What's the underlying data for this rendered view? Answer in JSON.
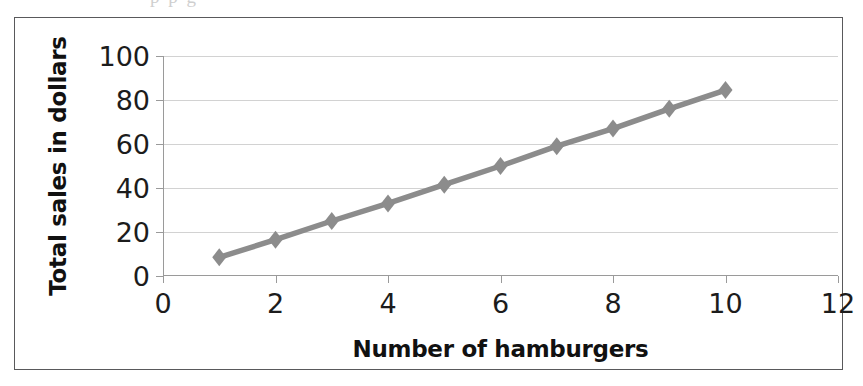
{
  "figure": {
    "scan_artifact_text": "p  p  g"
  },
  "chart_data": {
    "type": "line",
    "title": "",
    "xlabel": "Number of hamburgers",
    "ylabel": "Total sales in dollars",
    "x": [
      1,
      2,
      3,
      4,
      5,
      6,
      7,
      8,
      9,
      10
    ],
    "values": [
      8.5,
      16.5,
      25,
      33,
      41.5,
      50,
      59,
      67,
      76,
      84.5
    ],
    "series": [
      {
        "name": "Total sales",
        "values": [
          8.5,
          16.5,
          25,
          33,
          41.5,
          50,
          59,
          67,
          76,
          84.5
        ]
      }
    ],
    "xlim": [
      0,
      12
    ],
    "ylim": [
      0,
      100
    ],
    "xticks": [
      0,
      2,
      4,
      6,
      8,
      10,
      12
    ],
    "yticks": [
      0,
      20,
      40,
      60,
      80,
      100
    ],
    "xtick_labels": [
      "0",
      "2",
      "4",
      "6",
      "8",
      "10",
      "12"
    ],
    "ytick_labels": [
      "0",
      "20",
      "40",
      "60",
      "80",
      "100"
    ],
    "grid": "horizontal",
    "legend": "none",
    "marker": "diamond",
    "colors": {
      "line": "#8c8c8c",
      "marker": "#8c8c8c",
      "gridline": "#d2d2d2",
      "axis": "#9a9a9a",
      "text": "#1c1c1c",
      "frame": "#59595b",
      "background": "#ffffff"
    }
  }
}
